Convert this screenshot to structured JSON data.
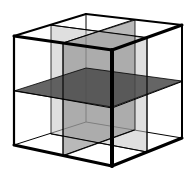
{
  "diagram": {
    "title": "Cube divided by three orthogonal mid-planes",
    "colors": {
      "background": "#ffffff",
      "edge": "#000000",
      "plane_depth": "#c4c4c4",
      "plane_width": "#8a8a8a",
      "plane_horizontal": "#4a4a4a"
    },
    "cube": {
      "vertices": {
        "front_top_left": [
          14,
          36
        ],
        "near_top": [
          112,
          50
        ],
        "back_top_right": [
          182,
          25
        ],
        "back_top_left": [
          86,
          14
        ],
        "front_bottom_left": [
          14,
          145
        ],
        "near_bottom": [
          112,
          166
        ],
        "back_bottom_right": [
          182,
          138
        ],
        "back_bottom_left": [
          86,
          122
        ]
      }
    },
    "planes": [
      {
        "name": "depth-mid-plane",
        "points": [
          [
            51,
            25
          ],
          [
            147,
            38
          ],
          [
            147,
            152
          ],
          [
            51,
            134
          ]
        ],
        "color_key": "plane_depth",
        "opacity": 0.55
      },
      {
        "name": "width-mid-plane",
        "points": [
          [
            63,
            43
          ],
          [
            135,
            20
          ],
          [
            135,
            130
          ],
          [
            63,
            156
          ]
        ],
        "color_key": "plane_width",
        "opacity": 0.6
      },
      {
        "name": "horizontal-mid-plane",
        "points": [
          [
            14,
            91
          ],
          [
            86,
            68
          ],
          [
            182,
            81
          ],
          [
            112,
            107
          ]
        ],
        "color_key": "plane_horizontal",
        "opacity": 0.85
      }
    ]
  }
}
